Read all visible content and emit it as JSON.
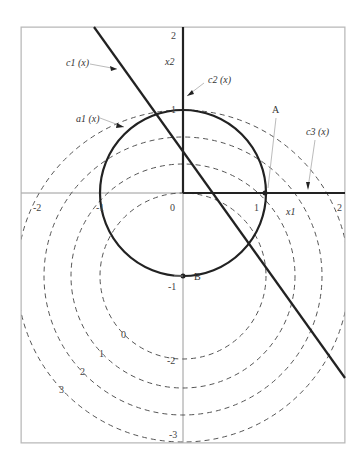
{
  "axes": {
    "x_label": "x1",
    "y_label": "x2",
    "x_ticks": [
      "-2",
      "-1",
      "0",
      "1",
      "2"
    ],
    "y_ticks": [
      "2",
      "1",
      "-1",
      "-2",
      "-3"
    ],
    "xlim": [
      -2,
      2
    ],
    "ylim": [
      -3,
      2
    ]
  },
  "curves": {
    "c1": "c1 (x)",
    "c2": "c2 (x)",
    "c3": "c3 (x)",
    "a1": "a1 (x)"
  },
  "points": {
    "A": "A",
    "B": "B"
  },
  "contours": {
    "left_labels": [
      "0",
      "1",
      "2",
      "3"
    ],
    "bottom_labels": [
      "-2",
      "-3"
    ]
  },
  "colors": {
    "ink": "#222222",
    "frame": "#b8b8b8",
    "dash": "#555555"
  }
}
